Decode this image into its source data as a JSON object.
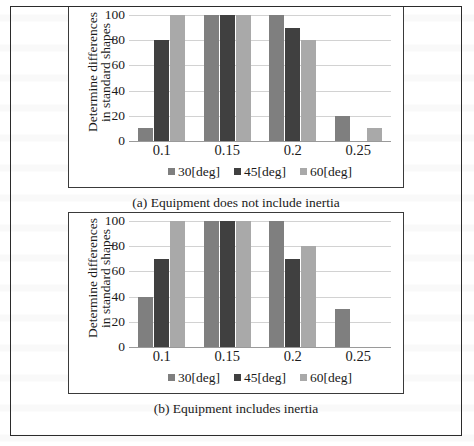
{
  "figure": {
    "panels": [
      {
        "id": "a",
        "caption": "(a) Equipment does not include inertia",
        "chart_data": {
          "type": "bar",
          "title": "",
          "xlabel": "",
          "ylabel": "Determine differences in standard shapes",
          "ylabel_lines": [
            "Determine differences",
            "in standard shapes"
          ],
          "categories": [
            "0.1",
            "0.15",
            "0.2",
            "0.25"
          ],
          "yticks": [
            0,
            20,
            40,
            60,
            80,
            100
          ],
          "ytick_labels": [
            "0",
            "20",
            "40",
            "60",
            "80",
            "100"
          ],
          "ylim": [
            0,
            100
          ],
          "grid": true,
          "legend_position": "bottom",
          "series": [
            {
              "name": "30[deg]",
              "color": "#7f7f7f",
              "values": [
                10,
                100,
                100,
                20
              ]
            },
            {
              "name": "45[deg]",
              "color": "#404040",
              "values": [
                80,
                100,
                90,
                0
              ]
            },
            {
              "name": "60[deg]",
              "color": "#a9a9a9",
              "values": [
                100,
                100,
                80,
                10
              ]
            }
          ]
        }
      },
      {
        "id": "b",
        "caption": "(b) Equipment includes inertia",
        "chart_data": {
          "type": "bar",
          "title": "",
          "xlabel": "",
          "ylabel": "Determine differences in standard shapes",
          "ylabel_lines": [
            "Determine differences",
            "in standard shapes"
          ],
          "categories": [
            "0.1",
            "0.15",
            "0.2",
            "0.25"
          ],
          "yticks": [
            0,
            20,
            40,
            60,
            80,
            100
          ],
          "ytick_labels": [
            "0",
            "20",
            "40",
            "60",
            "80",
            "100"
          ],
          "ylim": [
            0,
            100
          ],
          "grid": true,
          "legend_position": "bottom",
          "series": [
            {
              "name": "30[deg]",
              "color": "#7f7f7f",
              "values": [
                40,
                100,
                100,
                30
              ]
            },
            {
              "name": "45[deg]",
              "color": "#404040",
              "values": [
                70,
                100,
                70,
                0
              ]
            },
            {
              "name": "60[deg]",
              "color": "#a9a9a9",
              "values": [
                100,
                100,
                80,
                0
              ]
            }
          ]
        }
      }
    ]
  },
  "chart_data": [
    {
      "type": "bar",
      "title": "(a) Equipment does not include inertia",
      "xlabel": "",
      "ylabel": "Determine differences in standard shapes",
      "categories": [
        "0.1",
        "0.15",
        "0.2",
        "0.25"
      ],
      "ylim": [
        0,
        100
      ],
      "yticks": [
        0,
        20,
        40,
        60,
        80,
        100
      ],
      "grid": true,
      "legend_position": "bottom",
      "series": [
        {
          "name": "30[deg]",
          "values": [
            10,
            100,
            100,
            20
          ]
        },
        {
          "name": "45[deg]",
          "values": [
            80,
            100,
            90,
            0
          ]
        },
        {
          "name": "60[deg]",
          "values": [
            100,
            100,
            80,
            10
          ]
        }
      ]
    },
    {
      "type": "bar",
      "title": "(b) Equipment includes inertia",
      "xlabel": "",
      "ylabel": "Determine differences in standard shapes",
      "categories": [
        "0.1",
        "0.15",
        "0.2",
        "0.25"
      ],
      "ylim": [
        0,
        100
      ],
      "yticks": [
        0,
        20,
        40,
        60,
        80,
        100
      ],
      "grid": true,
      "legend_position": "bottom",
      "series": [
        {
          "name": "30[deg]",
          "values": [
            40,
            100,
            100,
            30
          ]
        },
        {
          "name": "45[deg]",
          "values": [
            70,
            100,
            70,
            0
          ]
        },
        {
          "name": "60[deg]",
          "values": [
            100,
            100,
            80,
            0
          ]
        }
      ]
    }
  ]
}
